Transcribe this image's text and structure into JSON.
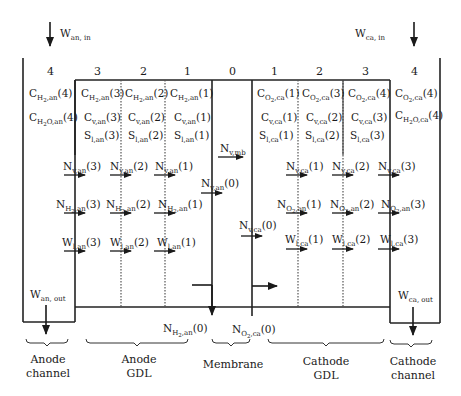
{
  "diagram": {
    "flows": {
      "anode_in": {
        "base": "W",
        "sub": "an, in"
      },
      "cathode_in": {
        "base": "W",
        "sub": "ca, in"
      },
      "anode_out": {
        "base": "W",
        "sub": "an, out"
      },
      "cathode_out": {
        "base": "W",
        "sub": "ca, out"
      }
    },
    "node_indices": {
      "anode": [
        "4",
        "3",
        "2",
        "1"
      ],
      "membrane": "0",
      "cathode": [
        "1",
        "2",
        "3",
        "4"
      ]
    },
    "anode_channel_states": [
      {
        "base": "C",
        "sub": "H",
        "subsub": "2",
        "sub2": ",an",
        "idx": "(4)"
      },
      {
        "base": "C",
        "sub": "H",
        "subsub": "2",
        "sub2": "O,an",
        "idx": "(4)"
      }
    ],
    "anode_gdl_states": {
      "row_h2": [
        {
          "base": "C",
          "sub": "H",
          "subsub": "2",
          "sub2": ",an",
          "idx": "(3)"
        },
        {
          "base": "C",
          "sub": "H",
          "subsub": "2",
          "sub2": ",an",
          "idx": "(2)"
        },
        {
          "base": "C",
          "sub": "H",
          "subsub": "2",
          "sub2": ",an",
          "idx": "(1)"
        }
      ],
      "row_v": [
        {
          "base": "C",
          "sub": "v,an",
          "idx": "(3)"
        },
        {
          "base": "C",
          "sub": "v,an",
          "idx": "(2)"
        },
        {
          "base": "C",
          "sub": "v,an",
          "idx": "(1)"
        }
      ],
      "row_s": [
        {
          "base": "S",
          "sub": "l,an",
          "idx": "(3)"
        },
        {
          "base": "S",
          "sub": "l,an",
          "idx": "(2)"
        },
        {
          "base": "S",
          "sub": "l,an",
          "idx": "(1)"
        }
      ]
    },
    "cathode_gdl_states": {
      "row_o2": [
        {
          "base": "C",
          "sub": "O",
          "subsub": "2",
          "sub2": ",ca",
          "idx": "(1)"
        },
        {
          "base": "C",
          "sub": "O",
          "subsub": "2",
          "sub2": ",ca",
          "idx": "(3)"
        },
        {
          "base": "C",
          "sub": "O",
          "subsub": "2",
          "sub2": ",ca",
          "idx": "(4)"
        }
      ],
      "row_v": [
        {
          "base": "C",
          "sub": "v,ca",
          "idx": "(1)"
        },
        {
          "base": "C",
          "sub": "v,ca",
          "idx": "(2)"
        },
        {
          "base": "C",
          "sub": "v,ca",
          "idx": "(3)"
        }
      ],
      "row_s": [
        {
          "base": "S",
          "sub": "l,ca",
          "idx": "(1)"
        },
        {
          "base": "S",
          "sub": "l,ca",
          "idx": "(2)"
        },
        {
          "base": "S",
          "sub": "l,ca",
          "idx": "(3)"
        }
      ]
    },
    "cathode_channel_states": [
      {
        "base": "C",
        "sub": "O",
        "subsub": "2",
        "sub2": ",ca",
        "idx": "(4)"
      },
      {
        "base": "C",
        "sub": "H",
        "subsub": "2",
        "sub2": "O,ca",
        "idx": "(4)"
      }
    ],
    "anode_fluxes": {
      "row_v": [
        {
          "base": "N",
          "sub": "v,an",
          "idx": "(3)"
        },
        {
          "base": "N",
          "sub": "v,an",
          "idx": "(2)"
        },
        {
          "base": "N",
          "sub": "v,an",
          "idx": "(1)"
        }
      ],
      "row_h2": [
        {
          "base": "N",
          "sub": "H",
          "subsub": "2",
          "sub2": ",an",
          "idx": "(3)"
        },
        {
          "base": "N",
          "sub": "H",
          "subsub": "2",
          "sub2": ",an",
          "idx": "(2)"
        },
        {
          "base": "N",
          "sub": "H",
          "subsub": "2",
          "sub2": ",an",
          "idx": "(1)"
        }
      ],
      "row_w": [
        {
          "base": "W",
          "sub": "l,an",
          "idx": "(3)"
        },
        {
          "base": "W",
          "sub": "l,an",
          "idx": "(2)"
        },
        {
          "base": "W",
          "sub": "l,an",
          "idx": "(1)"
        }
      ]
    },
    "membrane_fluxes": {
      "n_v_mb": {
        "base": "N",
        "sub": "v,mb",
        "idx": ""
      },
      "n_v_an0": {
        "base": "N",
        "sub": "v,an",
        "idx": "(0)"
      },
      "n_v_ca0": {
        "base": "N",
        "sub": "v,ca",
        "idx": "(0)"
      },
      "n_h2_an0": {
        "base": "N",
        "sub": "H",
        "subsub": "2",
        "sub2": ",an",
        "idx": "(0)"
      },
      "n_o2_ca0": {
        "base": "N",
        "sub": "O",
        "subsub": "2",
        "sub2": ",ca",
        "idx": "(0)"
      }
    },
    "cathode_fluxes": {
      "row_v": [
        {
          "base": "N",
          "sub": "v,ca",
          "idx": "(1)"
        },
        {
          "base": "N",
          "sub": "v,ca",
          "idx": "(2)"
        },
        {
          "base": "N",
          "sub": "v,ca",
          "idx": "(3)"
        }
      ],
      "row_o2": [
        {
          "base": "N",
          "sub": "O",
          "subsub": "2",
          "sub2": ",an",
          "idx": "(1)"
        },
        {
          "base": "N",
          "sub": "O",
          "subsub": "2",
          "sub2": ",an",
          "idx": "(2)"
        },
        {
          "base": "N",
          "sub": "O",
          "subsub": "2",
          "sub2": ",an",
          "idx": "(3)"
        }
      ],
      "row_w": [
        {
          "base": "W",
          "sub": "l,ca",
          "idx": "(1)"
        },
        {
          "base": "W",
          "sub": "l,ca",
          "idx": "(2)"
        },
        {
          "base": "W",
          "sub": "l,ca",
          "idx": "(3)"
        }
      ]
    },
    "region_labels": [
      {
        "line1": "Anode",
        "line2": "channel"
      },
      {
        "line1": "Anode",
        "line2": "GDL"
      },
      {
        "line1": "Membrane",
        "line2": ""
      },
      {
        "line1": "Cathode",
        "line2": "GDL"
      },
      {
        "line1": "Cathode",
        "line2": "channel"
      }
    ],
    "colors": {
      "line": "#222222",
      "divider": "#666666",
      "text": "#1a1a1a"
    }
  }
}
